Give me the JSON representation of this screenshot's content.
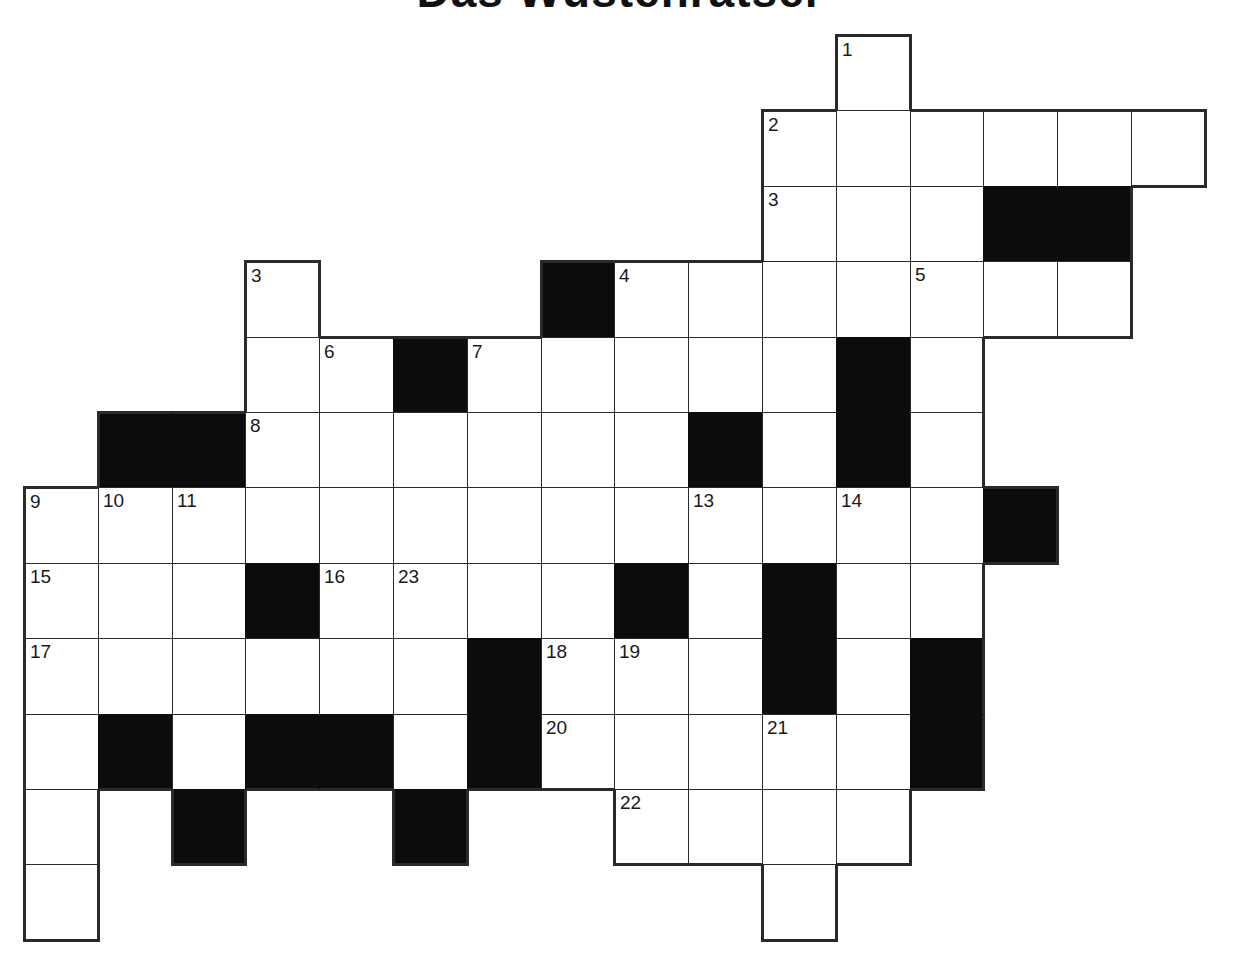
{
  "title": "Das Wüstenrätsel",
  "grid": {
    "origin_x": 24,
    "origin_y": 35,
    "cell_w": 73.8,
    "cell_h": 75.4,
    "cols": 16,
    "rows": 12,
    "colors": {
      "white_cell": "#ffffff",
      "black_cell": "#0c0c0c",
      "line": "#2a2a2a"
    },
    "layout": [
      "...........W....",
      "..........WWWWWW",
      "..........WWWBB.",
      "...W...BWWWWWWW.",
      "...WWBWWWWWBW...",
      ".BBWWWWWWBWBW...",
      "WWWWWWWWWWWWWB..",
      "WWWBWWWWBWBWW...",
      "WWWWWWBWWWBWB...",
      "WBWBBWBWWWWWB...",
      "W.B..B..WWWW....",
      "W.........W....."
    ],
    "numbers": [
      {
        "row": 0,
        "col": 11,
        "label": "1"
      },
      {
        "row": 1,
        "col": 10,
        "label": "2"
      },
      {
        "row": 2,
        "col": 10,
        "label": "3"
      },
      {
        "row": 3,
        "col": 3,
        "label": "3"
      },
      {
        "row": 3,
        "col": 8,
        "label": "4"
      },
      {
        "row": 3,
        "col": 12,
        "label": "5"
      },
      {
        "row": 4,
        "col": 4,
        "label": "6"
      },
      {
        "row": 4,
        "col": 6,
        "label": "7"
      },
      {
        "row": 5,
        "col": 3,
        "label": "8"
      },
      {
        "row": 6,
        "col": 0,
        "label": "9"
      },
      {
        "row": 6,
        "col": 1,
        "label": "10"
      },
      {
        "row": 6,
        "col": 2,
        "label": "11"
      },
      {
        "row": 6,
        "col": 9,
        "label": "13"
      },
      {
        "row": 6,
        "col": 11,
        "label": "14"
      },
      {
        "row": 7,
        "col": 0,
        "label": "15"
      },
      {
        "row": 7,
        "col": 4,
        "label": "16"
      },
      {
        "row": 7,
        "col": 5,
        "label": "23"
      },
      {
        "row": 8,
        "col": 0,
        "label": "17"
      },
      {
        "row": 8,
        "col": 7,
        "label": "18"
      },
      {
        "row": 8,
        "col": 8,
        "label": "19"
      },
      {
        "row": 9,
        "col": 7,
        "label": "20"
      },
      {
        "row": 9,
        "col": 10,
        "label": "21"
      },
      {
        "row": 10,
        "col": 8,
        "label": "22"
      }
    ]
  }
}
